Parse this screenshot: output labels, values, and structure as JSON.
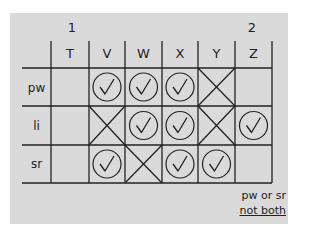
{
  "group_labels": [
    {
      "label": "1",
      "over_column": "T"
    },
    {
      "label": "2",
      "over_column": "Z"
    }
  ],
  "columns": [
    "T",
    "V",
    "W",
    "X",
    "Y",
    "Z"
  ],
  "rows": [
    {
      "label": "pw",
      "cells": [
        "",
        "check",
        "check",
        "check",
        "cross",
        ""
      ]
    },
    {
      "label": "li",
      "cells": [
        "",
        "cross",
        "check",
        "check",
        "cross",
        "check"
      ]
    },
    {
      "label": "sr",
      "cells": [
        "",
        "check",
        "cross",
        "check",
        "check",
        ""
      ]
    }
  ],
  "note": {
    "line1": "pw or sr",
    "line2": "not both"
  },
  "colors": {
    "background": "#ffffff",
    "panel": "#dadada",
    "ink": "#222222"
  }
}
